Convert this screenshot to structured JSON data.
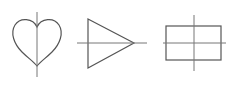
{
  "diagram": {
    "background": "#ffffff",
    "stroke_color": "#555555",
    "axis_color": "#777777",
    "shapes": [
      {
        "name": "heart",
        "axis": "vertical"
      },
      {
        "name": "triangle",
        "axis": "horizontal"
      },
      {
        "name": "rectangle",
        "axis": "both"
      }
    ]
  }
}
